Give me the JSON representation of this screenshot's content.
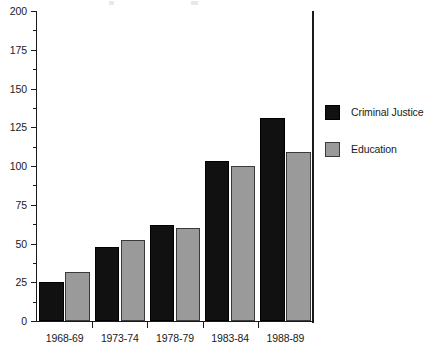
{
  "chart_data": {
    "type": "bar",
    "title": "",
    "subtitle": "",
    "xlabel": "",
    "ylabel": "",
    "categories": [
      "1968-69",
      "1973-74",
      "1978-79",
      "1983-84",
      "1988-89"
    ],
    "series": [
      {
        "name": "Criminal Justice",
        "color": "#111111",
        "values": [
          25,
          48,
          62,
          103,
          131
        ]
      },
      {
        "name": "Education",
        "color": "#9a9a9a",
        "values": [
          31.5,
          52,
          60,
          100,
          109
        ]
      }
    ],
    "ylim": [
      0,
      200
    ],
    "y_major_ticks": [
      0,
      25,
      50,
      75,
      100,
      125,
      150,
      175,
      200
    ],
    "y_tick_labels": [
      "0",
      "25",
      "50",
      "75",
      "100",
      "125",
      "150",
      "175",
      "200"
    ],
    "y_minor_ticks": [
      12.5,
      37.5,
      62.5,
      87.5,
      112.5,
      137.5,
      162.5,
      187.5
    ],
    "grid": false,
    "legend_position": "right",
    "bar_orientation": "vertical",
    "group_count": 5,
    "series_count": 2
  },
  "legend": {
    "entries": [
      {
        "label": "Criminal Justice",
        "swatch": "legend-swatch-criminal-justice"
      },
      {
        "label": "Education",
        "swatch": "legend-swatch-education"
      }
    ]
  },
  "axes": {
    "y_axis_name": "y-axis",
    "x_axis_name": "x-axis"
  }
}
